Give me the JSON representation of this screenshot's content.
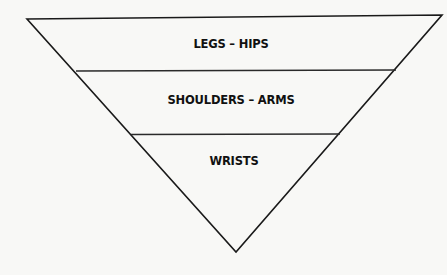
{
  "diagram": {
    "type": "inverted-pyramid",
    "tiers": [
      {
        "label": "LEGS – HIPS"
      },
      {
        "label": "SHOULDERS – ARMS"
      },
      {
        "label": "WRISTS"
      }
    ],
    "colors": {
      "background": "#f8f8f6",
      "line": "#1a1a1a",
      "text": "#111111"
    }
  }
}
